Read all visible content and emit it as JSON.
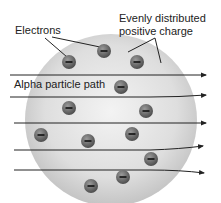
{
  "labels": {
    "electrons": "Electrons",
    "charge_line1": "Evenly distributed",
    "charge_line2": "positive charge",
    "alpha": "Alpha particle path"
  },
  "electron_symbol": "−",
  "colors": {
    "sphere_center": "#f0f0f0",
    "sphere_edge": "#bdbdbd",
    "electron": "#6a6a6a",
    "arrow": "#222222"
  }
}
